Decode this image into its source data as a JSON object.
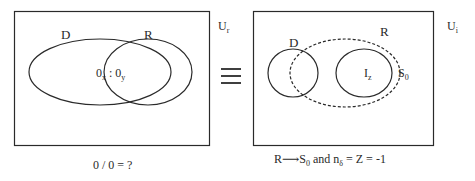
{
  "left_panel": {
    "universe_label": "U",
    "universe_sub": "r",
    "set_d_label": "D",
    "set_r_label": "R",
    "intersection_main_a": "0",
    "intersection_sub_a": "x",
    "intersection_sep": " : ",
    "intersection_main_b": "0",
    "intersection_sub_b": "y",
    "caption": "0 / 0 = ?"
  },
  "equivalence_symbol": "≡",
  "right_panel": {
    "universe_label": "U",
    "universe_sub": "i",
    "set_d_label": "D",
    "set_r_label": "R",
    "inner_set_main": "I",
    "inner_set_sub": "z",
    "boundary_main": "S",
    "boundary_sub": "0",
    "caption_r": "R",
    "caption_arrow": "⟶",
    "caption_s": "S",
    "caption_s_sub": "0",
    "caption_and": " and n",
    "caption_n_sub": "δ",
    "caption_rest": " = Z = -1"
  },
  "colors": {
    "stroke": "#2a2a2a",
    "background": "#ffffff"
  }
}
